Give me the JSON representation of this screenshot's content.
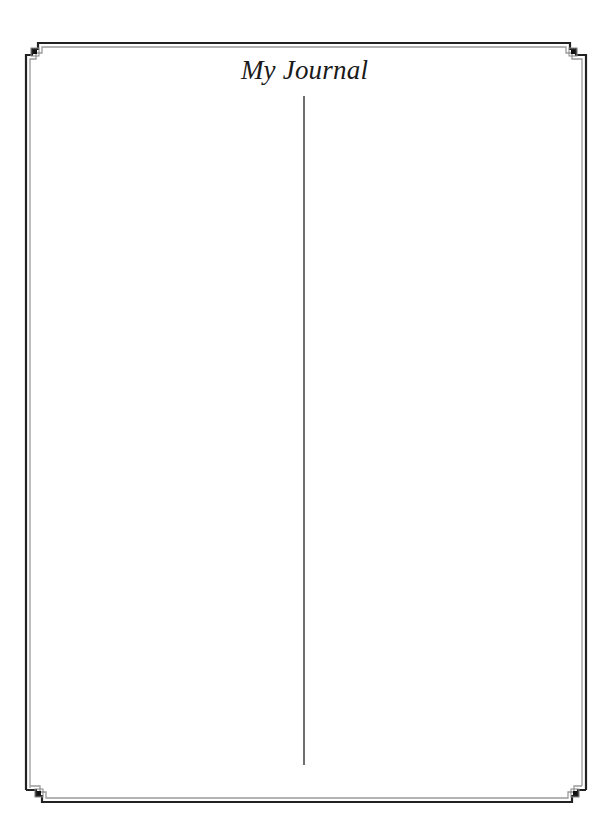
{
  "page": {
    "title": "My Journal",
    "layout": "two-column",
    "columns": [
      {
        "name": "left-column",
        "content": ""
      },
      {
        "name": "right-column",
        "content": ""
      }
    ]
  },
  "frame": {
    "style": "double-line border with greek-key corner ornaments",
    "outer_color": "#222222",
    "inner_color": "#9a9a9a"
  },
  "divider": {
    "color": "#6f6f6f"
  }
}
